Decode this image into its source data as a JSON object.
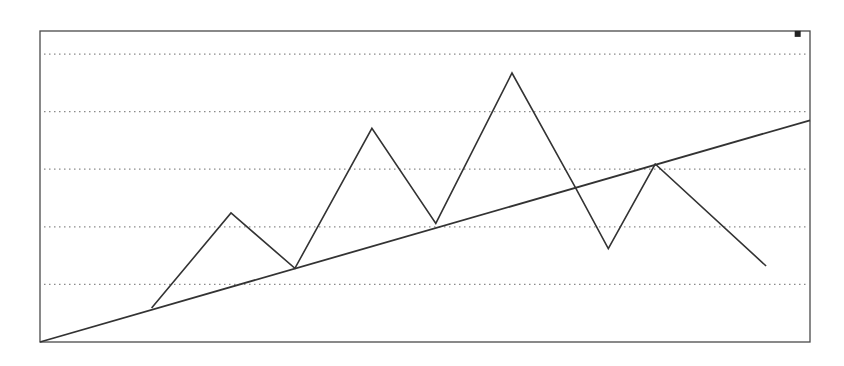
{
  "chart_data": {
    "type": "line",
    "title": "",
    "xlabel": "",
    "ylabel": "",
    "grid": true,
    "grid_style": "dotted horizontal",
    "legend": null,
    "plot_frame": {
      "left": 40,
      "top": 31,
      "right": 810,
      "bottom": 342
    },
    "ylim": [
      0,
      5.4
    ],
    "xlim": [
      0,
      10
    ],
    "gridlines_y": [
      1,
      2,
      3,
      4,
      5
    ],
    "series": [
      {
        "name": "price-zigzag",
        "x": [
          1.45,
          2.48,
          3.31,
          4.31,
          5.14,
          6.13,
          6.95,
          7.38,
          7.99,
          9.43
        ],
        "values": [
          0.59,
          2.24,
          1.28,
          3.71,
          2.06,
          4.67,
          2.69,
          1.62,
          3.09,
          1.32
        ]
      },
      {
        "name": "trend-line",
        "x": [
          0,
          10
        ],
        "values": [
          0,
          3.85
        ]
      }
    ],
    "annotations": [
      {
        "type": "marker",
        "shape": "square",
        "x": 9.84,
        "y": 5.35
      }
    ]
  },
  "colors": {
    "background": "#ffffff",
    "frame": "#4a4a4a",
    "grid": "#8a8a8a",
    "line": "#333333"
  }
}
